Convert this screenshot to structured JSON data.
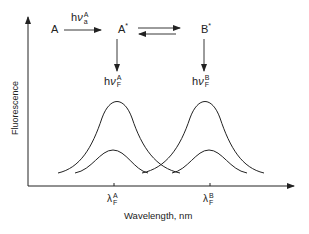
{
  "diagram": {
    "type": "fluorescence energy transfer spectrum",
    "states": {
      "ground_a": "A",
      "excited_a": "A",
      "excited_b": "B",
      "star": "*"
    },
    "transitions": {
      "absorption": {
        "h": "h",
        "nu": "ν",
        "sup": "A",
        "sub": "a"
      },
      "emission_a": {
        "h": "h",
        "nu": "ν",
        "sup": "A",
        "sub": "F"
      },
      "emission_b": {
        "h": "h",
        "nu": "ν",
        "sup": "B",
        "sub": "F"
      },
      "equilibrium": "A* ⇄ B*"
    },
    "axes": {
      "ylabel": "Fluorescence",
      "xlabel": "Wavelength, nm",
      "ticks": [
        {
          "symbol": "λ",
          "sup": "A",
          "sub": "F"
        },
        {
          "symbol": "λ",
          "sup": "B",
          "sub": "F"
        }
      ]
    },
    "curves": [
      {
        "name": "emission A (large)",
        "peak_x": "λF^A",
        "relative_height": "high"
      },
      {
        "name": "emission A (small)",
        "peak_x": "λF^A",
        "relative_height": "low"
      },
      {
        "name": "emission B (large)",
        "peak_x": "λF^B",
        "relative_height": "high"
      },
      {
        "name": "emission B (small)",
        "peak_x": "λF^B",
        "relative_height": "low"
      }
    ]
  }
}
